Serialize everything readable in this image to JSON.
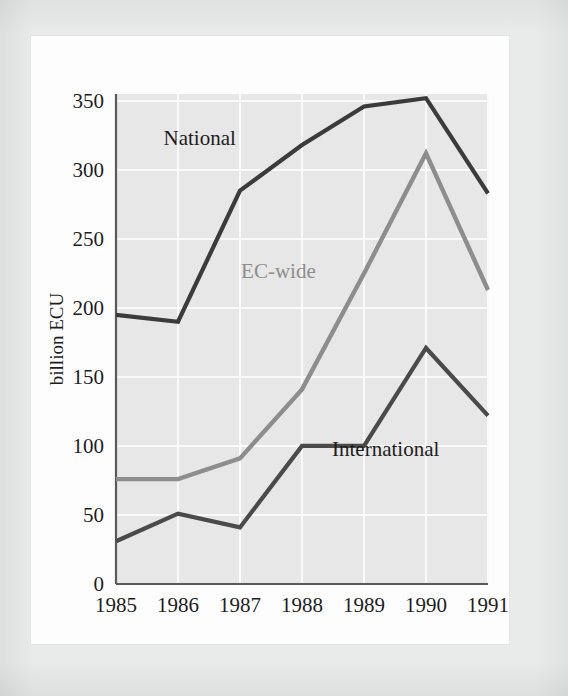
{
  "figure": {
    "page_background": "#fdfdfd",
    "outer_background": "#e9eaea",
    "plot_background": "#e7e7e7",
    "gridline_color": "#fafafa",
    "axis_color": "#5a5a5a"
  },
  "chart_data": {
    "type": "line",
    "title": "",
    "subtitle": "",
    "xlabel": "",
    "ylabel": "billion ECU",
    "x": [
      "1985",
      "1986",
      "1987",
      "1988",
      "1989",
      "1990",
      "1991"
    ],
    "categories": [
      "1985",
      "1986",
      "1987",
      "1988",
      "1989",
      "1990",
      "1991"
    ],
    "xlim": [
      1985,
      1991
    ],
    "ylim": [
      0,
      355
    ],
    "yticks": [
      0,
      50,
      100,
      150,
      200,
      250,
      300,
      350
    ],
    "ytick_labels": [
      "0",
      "50",
      "100",
      "150",
      "200",
      "250",
      "300",
      "350"
    ],
    "xtick_labels": [
      "1985",
      "1986",
      "1987",
      "1988",
      "1989",
      "1990",
      "1991"
    ],
    "grid": "horizontal-and-vertical, white on gray panel",
    "legend": "inline data labels, no legend box",
    "series": [
      {
        "name": "National",
        "color": "#3b3b3b",
        "stroke_width": 4.2,
        "values": [
          195,
          190,
          285,
          318,
          346,
          352,
          283
        ],
        "label": "National",
        "label_x": 1986.35,
        "label_y": 318
      },
      {
        "name": "EC-wide",
        "color": "#8d8d8d",
        "stroke_width": 4.4,
        "values": [
          76,
          76,
          91,
          141,
          225,
          312,
          213
        ],
        "label": "EC-wide",
        "label_x": 1987.62,
        "label_y": 222
      },
      {
        "name": "International",
        "color": "#4a4a4a",
        "stroke_width": 4.2,
        "values": [
          31,
          51,
          41,
          100,
          100,
          171,
          122
        ],
        "label": "International",
        "label_x": 1989.35,
        "label_y": 93
      }
    ]
  }
}
